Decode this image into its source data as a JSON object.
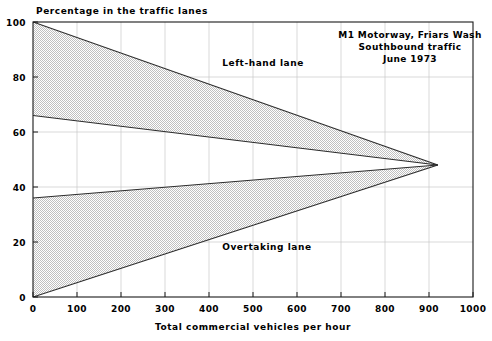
{
  "chart_data": {
    "type": "area",
    "title": "",
    "xlabel": "Total commercial vehicles per hour",
    "ylabel": "Percentage in the traffic lanes",
    "xlim": [
      0,
      1000
    ],
    "ylim": [
      0,
      100
    ],
    "xticks": [
      0,
      100,
      200,
      300,
      400,
      500,
      600,
      700,
      800,
      900,
      1000
    ],
    "yticks": [
      0,
      20,
      40,
      60,
      80,
      100
    ],
    "xtick_labels": [
      "0",
      "100",
      "200",
      "300",
      "400",
      "500",
      "600",
      "700",
      "800",
      "900",
      "1000"
    ],
    "ytick_labels": [
      "0",
      "20",
      "40",
      "60",
      "80",
      "100"
    ],
    "grid": true,
    "legend_position": "inline-annotations",
    "convergence_point": {
      "x": 920,
      "y": 48
    },
    "series": [
      {
        "name": "Left-hand lane upper boundary",
        "x": [
          0,
          920
        ],
        "values": [
          100,
          48
        ]
      },
      {
        "name": "Left-hand lane lower boundary",
        "x": [
          0,
          920
        ],
        "values": [
          66,
          48
        ]
      },
      {
        "name": "Overtaking lane upper boundary",
        "x": [
          0,
          920
        ],
        "values": [
          36,
          48
        ]
      },
      {
        "name": "Overtaking lane lower boundary",
        "x": [
          0,
          920
        ],
        "values": [
          0,
          48
        ]
      }
    ],
    "bands": [
      {
        "name": "Left-hand lane",
        "upper": [
          100,
          48
        ],
        "lower": [
          66,
          48
        ],
        "x": [
          0,
          920
        ],
        "fill": "stipple-gray"
      },
      {
        "name": "Overtaking lane",
        "upper": [
          36,
          48
        ],
        "lower": [
          0,
          48
        ],
        "x": [
          0,
          920
        ],
        "fill": "stipple-gray"
      }
    ],
    "annotations": [
      {
        "text": "Left-hand lane",
        "x": 430,
        "y": 84
      },
      {
        "text": "Overtaking lane",
        "x": 430,
        "y": 17
      }
    ],
    "note_block": [
      "M1 Motorway, Friars Wash",
      "Southbound traffic",
      "June 1973"
    ],
    "colors": {
      "line": "#2b2b2b",
      "grid": "#c8c8c8",
      "frame": "#1a1a1a",
      "band_fill": "#d9d9d9",
      "background": "#ffffff",
      "text": "#000000"
    }
  }
}
